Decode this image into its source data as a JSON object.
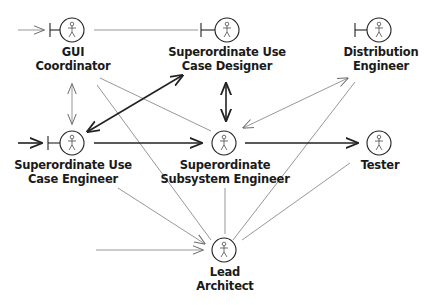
{
  "diagram": {
    "type": "actor-collaboration-diagram",
    "actors": [
      {
        "id": "gui",
        "line1": "GUI",
        "line2": "Coordinator",
        "x": 72,
        "y": 30,
        "boundary": true
      },
      {
        "id": "sucd",
        "line1": "Superordinate Use",
        "line2": "Case Designer",
        "x": 227,
        "y": 30,
        "boundary": true
      },
      {
        "id": "dist",
        "line1": "Distribution",
        "line2": "Engineer",
        "x": 379,
        "y": 30,
        "boundary": true
      },
      {
        "id": "suce",
        "line1": "Superordinate Use",
        "line2": "Case Engineer",
        "x": 72,
        "y": 143,
        "boundary": true
      },
      {
        "id": "sse",
        "line1": "Superordinate",
        "line2": "Subsystem Engineer",
        "x": 224,
        "y": 143,
        "boundary": false
      },
      {
        "id": "tester",
        "line1": "Tester",
        "line2": "",
        "x": 379,
        "y": 143,
        "boundary": false
      },
      {
        "id": "lead",
        "line1": "Lead",
        "line2": "Architect",
        "x": 224,
        "y": 250,
        "boundary": false
      }
    ],
    "connections": [
      {
        "from": "external",
        "to": "gui",
        "style": "thin",
        "arrow": "end"
      },
      {
        "from": "gui",
        "to": "sucd",
        "style": "thin",
        "arrow": "none"
      },
      {
        "from": "gui",
        "to": "suce",
        "style": "thin",
        "arrow": "both"
      },
      {
        "from": "gui",
        "to": "sse",
        "style": "thin",
        "arrow": "none"
      },
      {
        "from": "gui",
        "to": "lead",
        "style": "thin",
        "arrow": "none"
      },
      {
        "from": "sucd",
        "to": "suce",
        "style": "bold",
        "arrow": "both"
      },
      {
        "from": "sucd",
        "to": "sse",
        "style": "bold",
        "arrow": "both"
      },
      {
        "from": "dist",
        "to": "sse",
        "style": "thin",
        "arrow": "both"
      },
      {
        "from": "dist",
        "to": "lead",
        "style": "thin",
        "arrow": "none"
      },
      {
        "from": "external",
        "to": "suce",
        "style": "bold",
        "arrow": "end"
      },
      {
        "from": "suce",
        "to": "sse",
        "style": "bold",
        "arrow": "end"
      },
      {
        "from": "suce",
        "to": "lead",
        "style": "thin",
        "arrow": "end"
      },
      {
        "from": "sse",
        "to": "tester",
        "style": "bold",
        "arrow": "end"
      },
      {
        "from": "sse",
        "to": "lead",
        "style": "thin",
        "arrow": "none"
      },
      {
        "from": "tester",
        "to": "lead",
        "style": "thin",
        "arrow": "none"
      },
      {
        "from": "external",
        "to": "lead",
        "style": "thin",
        "arrow": "end"
      }
    ]
  }
}
